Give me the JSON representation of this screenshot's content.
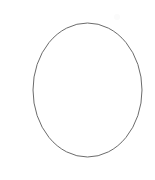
{
  "canvas": {
    "width": 155,
    "height": 180,
    "background_color": "#ffffff",
    "description": "Blank white canvas containing a single thin hand-drawn-style ellipse outline"
  },
  "shapes": [
    {
      "id": "ellipse-outline",
      "icon_name": "ellipse-outline-icon",
      "type": "ellipse",
      "stroke_color": "#6b6b6b",
      "stroke_width": 1,
      "fill": "none",
      "center_x": 87.5,
      "center_y": 90,
      "radius_x": 54.5,
      "radius_y": 67,
      "bounds": {
        "left": 33,
        "top": 23,
        "right": 142,
        "bottom": 157
      }
    },
    {
      "id": "faint-mark",
      "icon_name": "faint-speck-icon",
      "type": "speck",
      "stroke_color": "#fbfbfb",
      "center_x": 117,
      "center_y": 17,
      "radius_x": 3,
      "radius_y": 3
    }
  ],
  "labels": {
    "title": "",
    "caption": "",
    "annotations": []
  }
}
